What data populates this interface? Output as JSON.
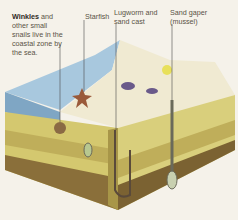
{
  "diagram": {
    "labels": [
      {
        "id": "winkles",
        "bold": "Winkles",
        "text": " and other small snails live in the coastal zone by the sea."
      },
      {
        "id": "starfish",
        "text": "Starfish"
      },
      {
        "id": "lugworm",
        "text": "Lugworm and sand cast"
      },
      {
        "id": "sand_gaper",
        "text": "Sand gaper (mussel)"
      }
    ],
    "colors": {
      "background": "#f5f2ea",
      "water": "#9fc0d8",
      "sand_top": "#f1ecd6",
      "layer_light": "#d9cf7c",
      "layer_mid": "#bfae5a",
      "layer_dark": "#8a6f3a",
      "leader_line": "#4a4a4a"
    }
  }
}
